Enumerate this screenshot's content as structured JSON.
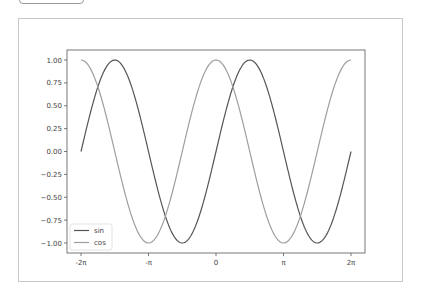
{
  "chart_data": {
    "type": "line",
    "title": "",
    "xlabel": "",
    "ylabel": "",
    "xlim": [
      -6.2832,
      6.2832
    ],
    "ylim": [
      -1.0,
      1.0
    ],
    "grid": false,
    "legend_position": "lower-left",
    "x_ticks": [
      {
        "value": -6.2832,
        "label": "-2π"
      },
      {
        "value": -3.1416,
        "label": "-π"
      },
      {
        "value": 0,
        "label": "0"
      },
      {
        "value": 3.1416,
        "label": "π"
      },
      {
        "value": 6.2832,
        "label": "2π"
      }
    ],
    "y_ticks": [
      {
        "value": 1.0,
        "label": "1.00"
      },
      {
        "value": 0.75,
        "label": "0.75"
      },
      {
        "value": 0.5,
        "label": "0.50"
      },
      {
        "value": 0.25,
        "label": "0.25"
      },
      {
        "value": 0.0,
        "label": "0.00"
      },
      {
        "value": -0.25,
        "label": "−0.25"
      },
      {
        "value": -0.5,
        "label": "−0.50"
      },
      {
        "value": -0.75,
        "label": "−0.75"
      },
      {
        "value": -1.0,
        "label": "−1.00"
      }
    ],
    "series": [
      {
        "name": "sin",
        "function": "sin(x)",
        "color": "#555555",
        "x_range": [
          -6.2832,
          6.2832
        ],
        "samples": 256
      },
      {
        "name": "cos",
        "function": "cos(x)",
        "color": "#9e9e9e",
        "x_range": [
          -6.2832,
          6.2832
        ],
        "samples": 256
      }
    ]
  },
  "legend": {
    "items": [
      {
        "label": "sin",
        "color": "#555555"
      },
      {
        "label": "cos",
        "color": "#9e9e9e"
      }
    ]
  },
  "colors": {
    "axes_frame": "#555555",
    "figure_border": "#c8c8c8",
    "tick_text": "#444444"
  }
}
